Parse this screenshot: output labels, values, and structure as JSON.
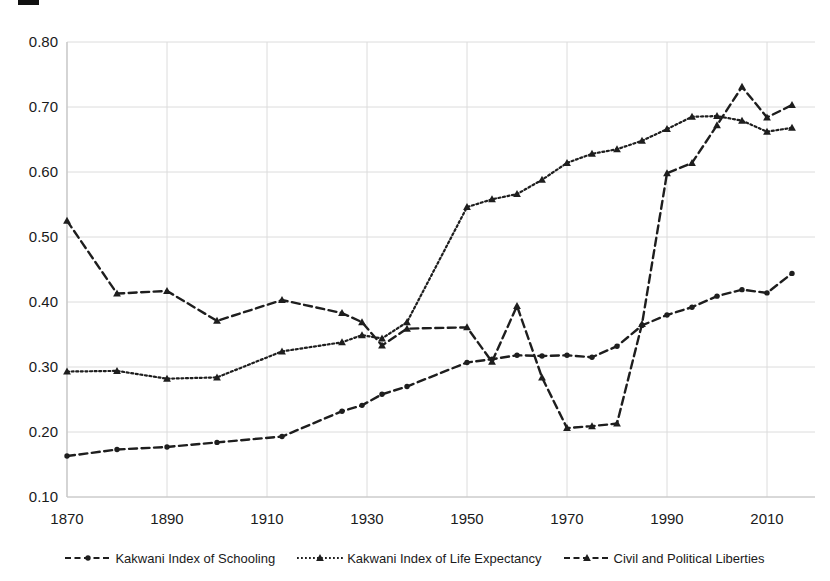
{
  "figure": {
    "background": "#ffffff",
    "ink": "#1e1e1e",
    "grid_color": "#dcdcdc",
    "axis_color": "#c4c4c4",
    "text_color": "#1a1a1a"
  },
  "chart_data": {
    "type": "line",
    "title": "",
    "xlabel": "",
    "ylabel": "",
    "grid": true,
    "legend_position": "bottom",
    "xlim": [
      1870,
      2019
    ],
    "ylim": [
      0.1,
      0.8
    ],
    "x_ticks": [
      "1870",
      "1890",
      "1910",
      "1930",
      "1950",
      "1970",
      "1990",
      "2010"
    ],
    "y_ticks": [
      "0.80",
      "0.70",
      "0.60",
      "0.50",
      "0.40",
      "0.30",
      "0.20",
      "0.10"
    ],
    "x": [
      1870,
      1880,
      1890,
      1900,
      1913,
      1925,
      1929,
      1933,
      1938,
      1950,
      1955,
      1960,
      1965,
      1970,
      1975,
      1980,
      1985,
      1990,
      1995,
      2000,
      2005,
      2010,
      2015
    ],
    "series": [
      {
        "name": "Kakwani Index of Schooling",
        "line_style": "dashed",
        "marker": "circle",
        "values": [
          0.163,
          0.173,
          0.177,
          0.184,
          0.193,
          0.232,
          0.241,
          0.258,
          0.27,
          0.307,
          0.312,
          0.318,
          0.317,
          0.318,
          0.315,
          0.332,
          0.364,
          0.38,
          0.392,
          0.409,
          0.419,
          0.414,
          0.444
        ]
      },
      {
        "name": "Kakwani Index of Life Expectancy",
        "line_style": "dotted",
        "marker": "triangle",
        "values": [
          0.293,
          0.294,
          0.282,
          0.284,
          0.324,
          0.338,
          0.349,
          0.344,
          0.369,
          0.546,
          0.558,
          0.566,
          0.588,
          0.614,
          0.628,
          0.635,
          0.648,
          0.666,
          0.685,
          0.686,
          0.679,
          0.662,
          0.668
        ]
      },
      {
        "name": "Civil and Political Liberties",
        "line_style": "dashed",
        "marker": "triangle",
        "values": [
          0.525,
          0.413,
          0.417,
          0.371,
          0.403,
          0.383,
          0.369,
          0.333,
          0.359,
          0.361,
          0.308,
          0.394,
          0.284,
          0.206,
          0.209,
          0.213,
          0.366,
          0.598,
          0.614,
          0.672,
          0.731,
          0.684,
          0.703
        ]
      }
    ]
  },
  "legend": {
    "items": [
      {
        "label": "Kakwani Index of Schooling"
      },
      {
        "label": "Kakwani Index of Life Expectancy"
      },
      {
        "label": "Civil and Political Liberties"
      }
    ]
  }
}
